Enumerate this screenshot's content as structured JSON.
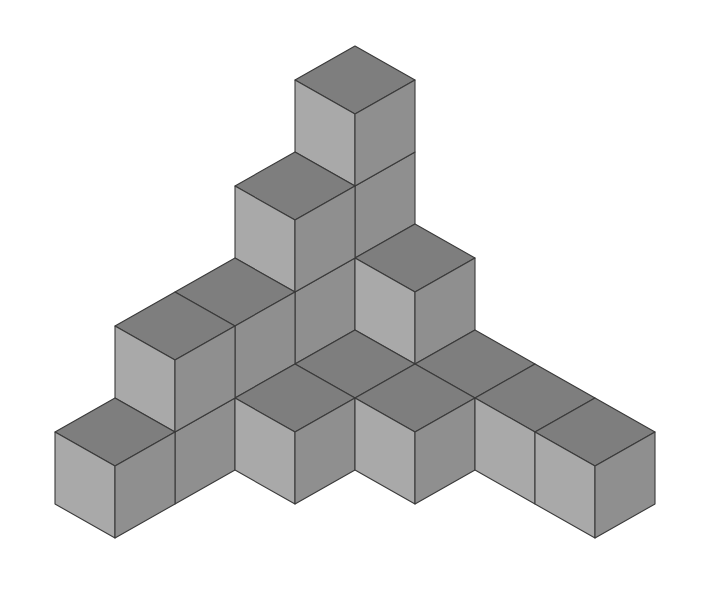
{
  "diagram": {
    "type": "isometric-cube-structure",
    "cube_count": 18,
    "projection": {
      "origin": [
        355,
        334
      ],
      "x_axis_step": [
        60,
        34
      ],
      "y_axis_step": [
        -60,
        34
      ],
      "z_step": 72
    },
    "colors": {
      "background": "#ffffff",
      "top_face": "#7e7e7e",
      "left_face": "#a9a9a9",
      "right_face": "#8f8f8f",
      "edge": "#3a3a3a"
    },
    "voxels": [
      [
        0,
        0,
        0
      ],
      [
        0,
        0,
        1
      ],
      [
        0,
        0,
        2
      ],
      [
        0,
        0,
        3
      ],
      [
        0,
        1,
        0
      ],
      [
        0,
        1,
        1
      ],
      [
        0,
        1,
        2
      ],
      [
        0,
        2,
        0
      ],
      [
        0,
        2,
        1
      ],
      [
        0,
        3,
        0
      ],
      [
        0,
        3,
        1
      ],
      [
        0,
        4,
        0
      ],
      [
        1,
        0,
        0
      ],
      [
        1,
        0,
        1
      ],
      [
        2,
        0,
        0
      ],
      [
        3,
        0,
        0
      ],
      [
        4,
        0,
        0
      ],
      [
        1,
        1,
        0
      ],
      [
        1,
        2,
        0
      ],
      [
        2,
        1,
        0
      ]
    ]
  }
}
